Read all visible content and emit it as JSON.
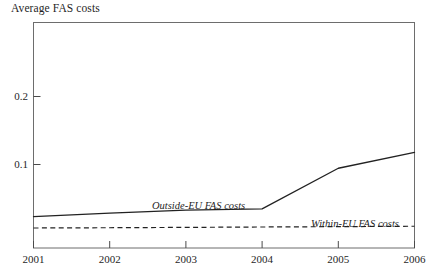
{
  "chart_data": {
    "type": "line",
    "title": "Average FAS costs",
    "xlabel": "",
    "ylabel": "",
    "x": [
      2001,
      2002,
      2003,
      2004,
      2005,
      2006
    ],
    "xlim": [
      2001,
      2006
    ],
    "ylim": [
      0,
      0.2353
    ],
    "grid": false,
    "legend_position": "inline-annotations",
    "y_ticks": [
      {
        "value": 0.2,
        "label": "0.2"
      },
      {
        "value": 0.1,
        "label": "0.1"
      }
    ],
    "x_ticks": [
      {
        "value": 2001,
        "label": "2001"
      },
      {
        "value": 2002,
        "label": "2002"
      },
      {
        "value": 2003,
        "label": "2003"
      },
      {
        "value": 2004,
        "label": "2004"
      },
      {
        "value": 2005,
        "label": "2005"
      },
      {
        "value": 2006,
        "label": "2006"
      }
    ],
    "series": [
      {
        "name": "Outside-EU FAS costs",
        "style": "solid",
        "color": "#222222",
        "annotation": "Outside-EU FAS costs",
        "values": [
          0.0228,
          0.0279,
          0.0324,
          0.0341,
          0.0941,
          0.1176
        ]
      },
      {
        "name": "Within-EU FAS costs",
        "style": "dashed",
        "color": "#222222",
        "annotation": "Within-EU FAS costs",
        "values": [
          0.0059,
          0.0063,
          0.0068,
          0.0074,
          0.0079,
          0.0085
        ]
      }
    ]
  },
  "annotations": {
    "outside_eu_label": "Outside-EU FAS costs",
    "within_eu_label": "Within-EU FAS costs"
  },
  "axis": {
    "y_tick_0": "0.2",
    "y_tick_1": "0.1",
    "x_tick_0": "2001",
    "x_tick_1": "2002",
    "x_tick_2": "2003",
    "x_tick_3": "2004",
    "x_tick_4": "2005",
    "x_tick_5": "2006"
  },
  "colors": {
    "axis": "#4a4a4a",
    "series_line": "#222222",
    "text": "#1f1f1f",
    "background": "#ffffff"
  }
}
